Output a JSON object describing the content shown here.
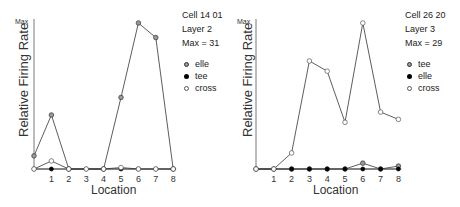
{
  "chart_data": [
    {
      "type": "line",
      "title": "Cell 14 01",
      "info": [
        "Cell 14 01",
        "Layer 2",
        "Max = 31"
      ],
      "xlabel": "Location",
      "ylabel": "Relative Firing Rate",
      "y_top_label": "Max",
      "x": [
        0,
        1,
        2,
        3,
        4,
        5,
        6,
        7,
        8
      ],
      "x_tick_labels": [
        "1",
        "2",
        "3",
        "4",
        "5",
        "6",
        "7",
        "8"
      ],
      "ylim": [
        0,
        1
      ],
      "max_rate": 31,
      "grid": false,
      "legend_position": "right",
      "series": [
        {
          "name": "elle",
          "marker": "crossed-circle",
          "values": [
            0.09,
            0.37,
            0,
            null,
            0,
            0.49,
            1.0,
            0.9,
            0
          ]
        },
        {
          "name": "tee",
          "marker": "filled-circle",
          "values": [
            0,
            0,
            0,
            0,
            0,
            0,
            0,
            0,
            0
          ]
        },
        {
          "name": "cross",
          "marker": "open-circle",
          "values": [
            0,
            0.055,
            0,
            0,
            0,
            0.01,
            0,
            0,
            0
          ]
        }
      ]
    },
    {
      "type": "line",
      "title": "Cell 26 20",
      "info": [
        "Cell 26 20",
        "Layer 3",
        "Max = 29"
      ],
      "xlabel": "Location",
      "ylabel": "Relative Firing Rate",
      "y_top_label": "Max",
      "x": [
        0,
        1,
        2,
        3,
        4,
        5,
        6,
        7,
        8
      ],
      "x_tick_labels": [
        "1",
        "2",
        "3",
        "4",
        "5",
        "6",
        "7",
        "8"
      ],
      "ylim": [
        0,
        1
      ],
      "max_rate": 29,
      "grid": false,
      "legend_position": "right",
      "series": [
        {
          "name": "tee",
          "marker": "crossed-circle",
          "values": [
            0,
            0,
            0,
            0,
            0,
            0,
            0.04,
            0,
            0.02
          ]
        },
        {
          "name": "elle",
          "marker": "filled-circle",
          "values": [
            0,
            0,
            0,
            0,
            0,
            0,
            0,
            0,
            0
          ]
        },
        {
          "name": "cross",
          "marker": "open-circle",
          "values": [
            0,
            0,
            0.11,
            0.74,
            0.67,
            0.32,
            1.0,
            0.39,
            0.34
          ]
        }
      ]
    }
  ],
  "panels": [
    {
      "info": {
        "cell": "Cell 14 01",
        "layer": "Layer 2",
        "max": "Max = 31"
      },
      "legend": [
        {
          "label": "elle",
          "marker": "elle"
        },
        {
          "label": "tee",
          "marker": "tee"
        },
        {
          "label": "cross",
          "marker": "cross"
        }
      ],
      "ylabel": "Relative Firing Rate",
      "xlabel": "Location",
      "max_label": "Max",
      "ticks": [
        "1",
        "2",
        "3",
        "4",
        "5",
        "6",
        "7",
        "8"
      ]
    },
    {
      "info": {
        "cell": "Cell 26 20",
        "layer": "Layer 3",
        "max": "Max = 29"
      },
      "legend": [
        {
          "label": "tee",
          "marker": "elle"
        },
        {
          "label": "elle",
          "marker": "tee"
        },
        {
          "label": "cross",
          "marker": "cross"
        }
      ],
      "ylabel": "Relative Firing Rate",
      "xlabel": "Location",
      "max_label": "Max",
      "ticks": [
        "1",
        "2",
        "3",
        "4",
        "5",
        "6",
        "7",
        "8"
      ]
    }
  ]
}
